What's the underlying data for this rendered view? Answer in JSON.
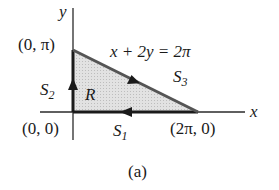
{
  "figure": {
    "caption": "(a)",
    "axes": {
      "x_label": "x",
      "y_label": "y"
    },
    "region_label": "R",
    "equation": "x + 2y = 2π",
    "points": {
      "origin": "(0, 0)",
      "top": "(0, π)",
      "right": "(2π, 0)"
    },
    "segments": [
      {
        "name": "S",
        "index": "1",
        "direction": "from (2π, 0) to (0, 0)"
      },
      {
        "name": "S",
        "index": "2",
        "direction": "from (0, 0) to (0, π)"
      },
      {
        "name": "S",
        "index": "3",
        "direction": "from (0, π) to (2π, 0)"
      }
    ],
    "colors": {
      "region_fill": "#d9d9d9",
      "line": "#2a2a2a",
      "boundary": "#555555"
    }
  }
}
